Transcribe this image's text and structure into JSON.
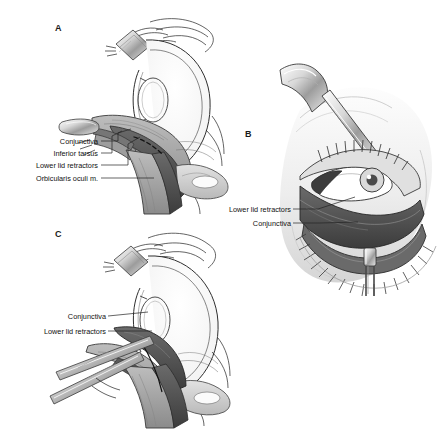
{
  "figure": {
    "background_color": "#ffffff",
    "ink_color": "#1a1a1a",
    "width": 442,
    "height": 433
  },
  "panels": [
    {
      "letter": "A",
      "name": "panel-a",
      "view": "sagittal cross-section of globe and lower eyelid",
      "letter_x": 55,
      "letter_y": 30,
      "labels": [
        {
          "text": "Conjunctiva",
          "x": 98,
          "y": 143,
          "tip_x": 131,
          "tip_y": 129
        },
        {
          "text": "Inferior tarsus",
          "x": 98,
          "y": 155,
          "tip_x": 122,
          "tip_y": 131
        },
        {
          "text": "Lower lid retractors",
          "x": 98,
          "y": 167,
          "tip_x": 140,
          "tip_y": 136
        },
        {
          "text": "Orbicularis oculi m.",
          "x": 98,
          "y": 180,
          "tip_x": 154,
          "tip_y": 180
        }
      ]
    },
    {
      "letter": "B",
      "name": "panel-b",
      "view": "anterior view of everted lower eyelid with Desmarres retractor",
      "letter_x": 248,
      "letter_y": 136,
      "labels": [
        {
          "text": "Lower lid retractors",
          "x": 296,
          "y": 211,
          "tip_x": 355,
          "tip_y": 197
        },
        {
          "text": "Conjunctiva",
          "x": 296,
          "y": 225,
          "tip_x": 358,
          "tip_y": 222
        }
      ]
    },
    {
      "letter": "C",
      "name": "panel-c",
      "view": "sagittal cross-section showing recessed lower lid retractors",
      "letter_x": 55,
      "letter_y": 236,
      "labels": [
        {
          "text": "Conjunctiva",
          "x": 105,
          "y": 318,
          "tip_x": 148,
          "tip_y": 312
        },
        {
          "text": "Lower lid retractors",
          "x": 105,
          "y": 333,
          "tip_x": 152,
          "tip_y": 331
        }
      ]
    }
  ],
  "palette": {
    "line": "#2b2b2b",
    "tissue_light": "#cfcfcf",
    "tissue_mid": "#9a9a9a",
    "tissue_dark": "#6e6e6e",
    "tissue_darkest": "#4a4a4a",
    "metal_light": "#e6e6e6",
    "metal_mid": "#b5b5b5",
    "skin_light": "#ededed",
    "white": "#ffffff"
  }
}
